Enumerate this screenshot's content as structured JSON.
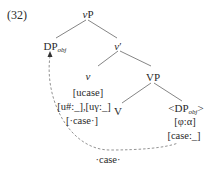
{
  "example_number": "(32)",
  "tree": {
    "root": {
      "label": "vP",
      "italic_part": "v",
      "rest": "P"
    },
    "spec": {
      "label": "DP",
      "sub": "obj"
    },
    "vbar": {
      "label": "v′",
      "italic_part": "v",
      "rest": "′"
    },
    "head_v": {
      "label": "v",
      "features": [
        "[ucase]",
        "[u#:_],[uγ:_]",
        "[·case·]"
      ]
    },
    "vp": {
      "label": "VP"
    },
    "verb": {
      "label": "V"
    },
    "object": {
      "label_pre": "<DP",
      "sub": "obj",
      "label_post": ">",
      "features": [
        "[φ:α]",
        "[case:_]"
      ]
    }
  },
  "movement_arrow": {
    "label": "·case·",
    "style": "dashed"
  },
  "colors": {
    "ink": "#2a2a2a",
    "line": "#555555"
  }
}
